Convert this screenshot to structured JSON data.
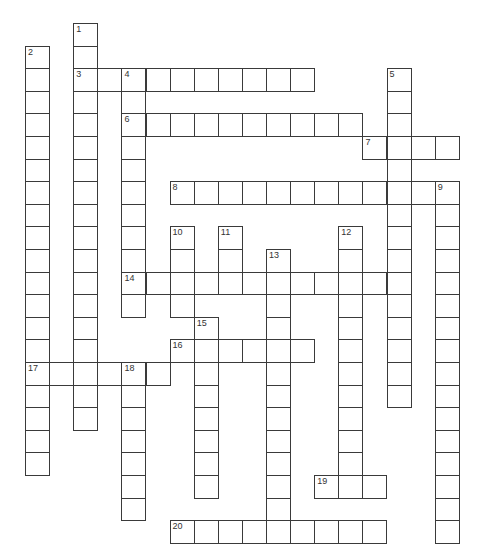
{
  "puzzle": {
    "type": "crossword",
    "grid": {
      "origin_x": 25,
      "origin_y": 23,
      "cell_width": 24.1,
      "cell_height": 22.6,
      "line_color": "#3a3a3a",
      "number_color": "#333333"
    },
    "words": [
      {
        "number": "1",
        "direction": "down",
        "row": 0,
        "col": 2,
        "length": 18
      },
      {
        "number": "2",
        "direction": "down",
        "row": 1,
        "col": 0,
        "length": 19
      },
      {
        "number": "3",
        "direction": "across",
        "row": 2,
        "col": 2,
        "length": 10
      },
      {
        "number": "4",
        "direction": "down",
        "row": 2,
        "col": 4,
        "length": 11
      },
      {
        "number": "5",
        "direction": "down",
        "row": 2,
        "col": 15,
        "length": 15
      },
      {
        "number": "6",
        "direction": "across",
        "row": 4,
        "col": 4,
        "length": 10
      },
      {
        "number": "7",
        "direction": "across",
        "row": 5,
        "col": 14,
        "length": 4
      },
      {
        "number": "8",
        "direction": "across",
        "row": 7,
        "col": 6,
        "length": 12
      },
      {
        "number": "9",
        "direction": "down",
        "row": 7,
        "col": 17,
        "length": 16
      },
      {
        "number": "10",
        "direction": "down",
        "row": 9,
        "col": 6,
        "length": 4
      },
      {
        "number": "11",
        "direction": "down",
        "row": 9,
        "col": 8,
        "length": 3
      },
      {
        "number": "12",
        "direction": "down",
        "row": 9,
        "col": 13,
        "length": 12
      },
      {
        "number": "13",
        "direction": "down",
        "row": 10,
        "col": 10,
        "length": 13
      },
      {
        "number": "14",
        "direction": "across",
        "row": 11,
        "col": 4,
        "length": 12
      },
      {
        "number": "15",
        "direction": "down",
        "row": 13,
        "col": 7,
        "length": 8
      },
      {
        "number": "16",
        "direction": "across",
        "row": 14,
        "col": 6,
        "length": 6
      },
      {
        "number": "17",
        "direction": "across",
        "row": 15,
        "col": 0,
        "length": 6
      },
      {
        "number": "18",
        "direction": "down",
        "row": 15,
        "col": 4,
        "length": 7
      },
      {
        "number": "19",
        "direction": "across",
        "row": 20,
        "col": 12,
        "length": 3
      },
      {
        "number": "20",
        "direction": "across",
        "row": 22,
        "col": 6,
        "length": 9
      }
    ]
  }
}
